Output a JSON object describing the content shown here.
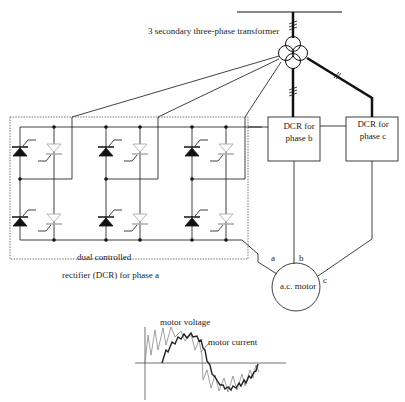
{
  "diagram": {
    "title": "3 secondary three-phase transformer",
    "dcr_a_label_line1": "dual controlled",
    "dcr_a_label_line2": "rectifier (DCR) for phase a",
    "dcr_b": {
      "line1": "DCR for",
      "line2": "phase b"
    },
    "dcr_c": {
      "line1": "DCR for",
      "line2": "phase c"
    },
    "motor_label": "a.c. motor",
    "phase_labels": {
      "a": "a",
      "b": "b",
      "c": "c"
    },
    "waveform": {
      "voltage_label": "motor voltage",
      "current_label": "motor current"
    },
    "colors": {
      "line": "#111111",
      "thyristor_light": "#bbbbbb",
      "dashed": "#555555"
    }
  }
}
